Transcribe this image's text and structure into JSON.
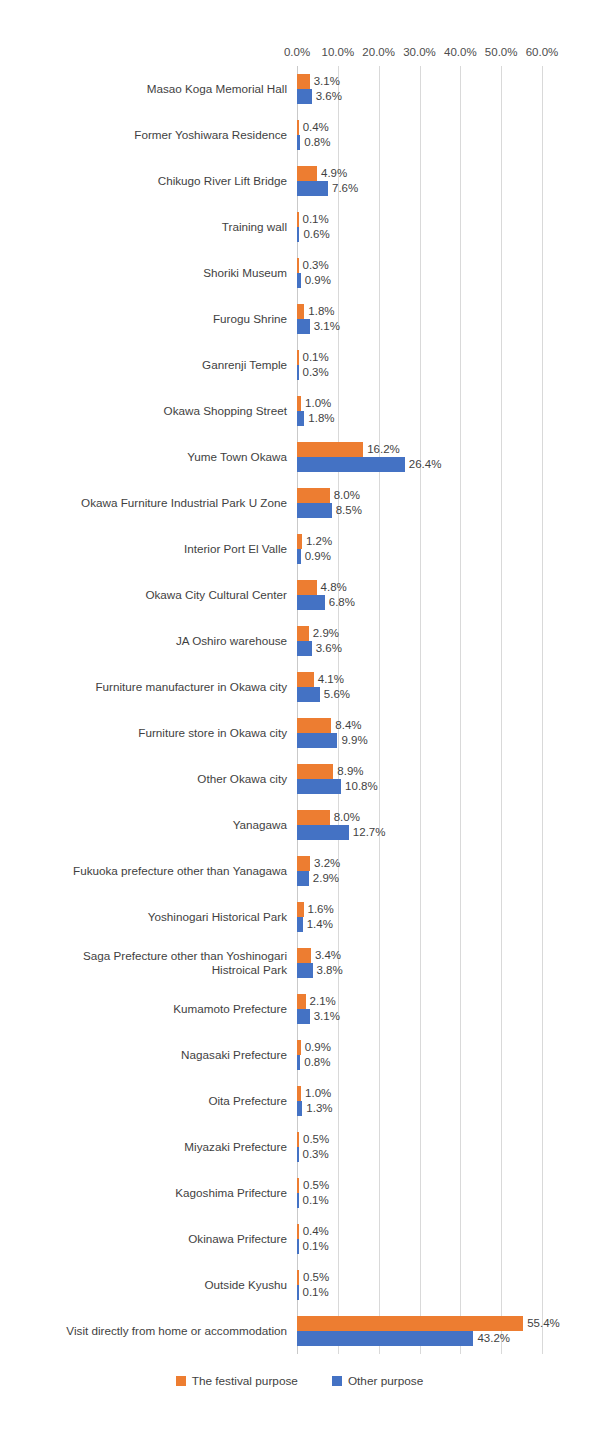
{
  "chart_data": {
    "type": "bar",
    "orientation": "horizontal",
    "title": "",
    "xlabel": "",
    "ylabel": "",
    "xlim": [
      0,
      60
    ],
    "xticks": [
      "0.0%",
      "10.0%",
      "20.0%",
      "30.0%",
      "40.0%",
      "50.0%",
      "60.0%"
    ],
    "xtick_values": [
      0,
      10,
      20,
      30,
      40,
      50,
      60
    ],
    "grid": true,
    "legend_position": "bottom",
    "colors": {
      "series0": "#ED7D31",
      "series1": "#4472C4",
      "gridline": "#D9D9D9",
      "text": "#3F3F3F"
    },
    "categories": [
      "Masao Koga Memorial Hall",
      "Former Yoshiwara Residence",
      "Chikugo River Lift Bridge",
      "Training wall",
      "Shoriki Museum",
      "Furogu Shrine",
      "Ganrenji Temple",
      "Okawa Shopping Street",
      "Yume Town Okawa",
      "Okawa Furniture Industrial Park U Zone",
      "Interior Port El Valle",
      "Okawa City Cultural Center",
      "JA Oshiro warehouse",
      "Furniture manufacturer in Okawa city",
      "Furniture store in Okawa city",
      "Other Okawa city",
      "Yanagawa",
      "Fukuoka prefecture other than Yanagawa",
      "Yoshinogari Historical Park",
      "Saga Prefecture other than Yoshinogari Histroical Park",
      "Kumamoto Prefecture",
      "Nagasaki Prefecture",
      "Oita Prefecture",
      "Miyazaki Prefecture",
      "Kagoshima Prifecture",
      "Okinawa Prifecture",
      "Outside Kyushu",
      "Visit directly from home or accommodation"
    ],
    "series": [
      {
        "name": "The festival purpose",
        "values": [
          3.1,
          0.4,
          4.9,
          0.1,
          0.3,
          1.8,
          0.1,
          1.0,
          16.2,
          8.0,
          1.2,
          4.8,
          2.9,
          4.1,
          8.4,
          8.9,
          8.0,
          3.2,
          1.6,
          3.4,
          2.1,
          0.9,
          1.0,
          0.5,
          0.5,
          0.4,
          0.5,
          55.4
        ],
        "labels": [
          "3.1%",
          "0.4%",
          "4.9%",
          "0.1%",
          "0.3%",
          "1.8%",
          "0.1%",
          "1.0%",
          "16.2%",
          "8.0%",
          "1.2%",
          "4.8%",
          "2.9%",
          "4.1%",
          "8.4%",
          "8.9%",
          "8.0%",
          "3.2%",
          "1.6%",
          "3.4%",
          "2.1%",
          "0.9%",
          "1.0%",
          "0.5%",
          "0.5%",
          "0.4%",
          "0.5%",
          "55.4%"
        ]
      },
      {
        "name": "Other purpose",
        "values": [
          3.6,
          0.8,
          7.6,
          0.6,
          0.9,
          3.1,
          0.3,
          1.8,
          26.4,
          8.5,
          0.9,
          6.8,
          3.6,
          5.6,
          9.9,
          10.8,
          12.7,
          2.9,
          1.4,
          3.8,
          3.1,
          0.8,
          1.3,
          0.3,
          0.1,
          0.1,
          0.1,
          43.2
        ],
        "labels": [
          "3.6%",
          "0.8%",
          "7.6%",
          "0.6%",
          "0.9%",
          "3.1%",
          "0.3%",
          "1.8%",
          "26.4%",
          "8.5%",
          "0.9%",
          "6.8%",
          "3.6%",
          "5.6%",
          "9.9%",
          "10.8%",
          "12.7%",
          "2.9%",
          "1.4%",
          "3.8%",
          "3.1%",
          "0.8%",
          "1.3%",
          "0.3%",
          "0.1%",
          "0.1%",
          "0.1%",
          "43.2%"
        ]
      }
    ]
  },
  "legend": {
    "items": [
      {
        "label": "The festival purpose",
        "color": "#ED7D31"
      },
      {
        "label": "Other purpose",
        "color": "#4472C4"
      }
    ]
  }
}
